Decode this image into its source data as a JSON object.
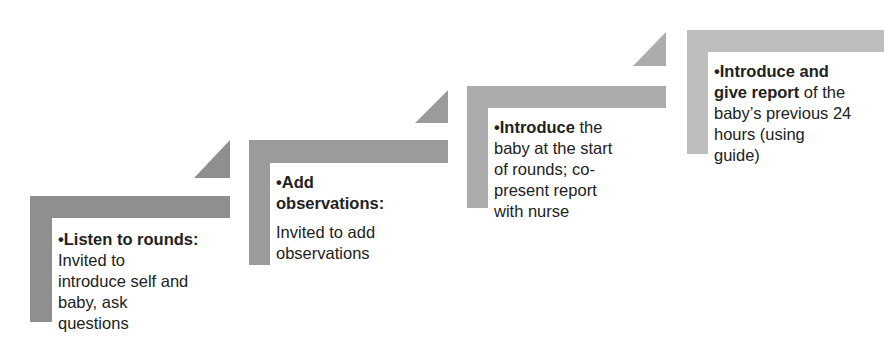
{
  "diagram": {
    "type": "staircase",
    "steps": [
      {
        "id": 1,
        "color": "#8f8f8f",
        "bold_text": "•Listen to rounds:",
        "lines": [
          "Invited to",
          "introduce self and",
          "baby, ask",
          "questions"
        ]
      },
      {
        "id": 2,
        "color": "#9b9b9b",
        "bold_line1": "•Add",
        "bold_line2": "observations:",
        "lines": [
          "Invited to add",
          "observations"
        ]
      },
      {
        "id": 3,
        "color": "#acacac",
        "bold_text": "•Introduce",
        "first_line_rest": " the",
        "lines": [
          "baby at the start",
          "of rounds; co-",
          "present report",
          "with nurse"
        ]
      },
      {
        "id": 4,
        "color": "#bebebe",
        "bold_line1": "•Introduce and",
        "bold_line2": "give report",
        "line2_rest": " of the",
        "lines": [
          "baby’s previous 24",
          "hours (using",
          "guide)"
        ]
      }
    ]
  }
}
